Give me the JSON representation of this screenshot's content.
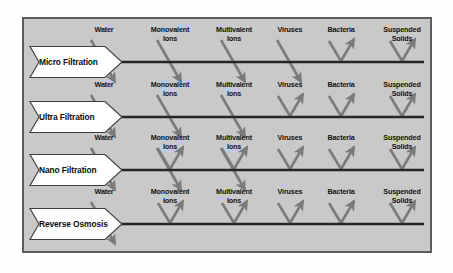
{
  "figure": {
    "panel_bg": "#c9c9c9",
    "panel_border": "#5d5d5d",
    "arrow_color": "#7b7b7b",
    "membrane_color": "#262626",
    "banner_fill": "#ffffff",
    "banner_stroke": "#3d3d3d"
  },
  "chart_data": {
    "type": "diagram",
    "xlabel": "",
    "ylabel": "",
    "categories": [
      "Water",
      "Monovalent Ions",
      "Multivalent Ions",
      "Viruses",
      "Bacteria",
      "Suspended Solids"
    ],
    "legend": [
      "pass = arrow crosses membrane downward",
      "reject = arrow deflects upward"
    ],
    "series": [
      {
        "name": "Micro Filtration",
        "values": [
          "pass",
          "pass",
          "pass",
          "pass",
          "reject",
          "reject"
        ]
      },
      {
        "name": "Ultra Filtration",
        "values": [
          "pass",
          "pass",
          "pass",
          "reject",
          "reject",
          "reject"
        ]
      },
      {
        "name": "Nano Filtration",
        "values": [
          "pass",
          "partial",
          "partial",
          "reject",
          "reject",
          "reject"
        ]
      },
      {
        "name": "Reverse Osmosis",
        "values": [
          "pass",
          "reject",
          "reject",
          "reject",
          "reject",
          "reject"
        ]
      }
    ]
  },
  "rows": [
    {
      "stage": "Micro Filtration",
      "membrane_y": 62,
      "label_y": 26,
      "banner_cy": 62,
      "species": [
        {
          "name": "Water",
          "x": 104,
          "mode": "pass"
        },
        {
          "name": "Monovalent\nIons",
          "x": 170,
          "mode": "pass"
        },
        {
          "name": "Multivalent\nIons",
          "x": 234,
          "mode": "pass"
        },
        {
          "name": "Viruses",
          "x": 290,
          "mode": "pass"
        },
        {
          "name": "Bacteria",
          "x": 341,
          "mode": "reject"
        },
        {
          "name": "Suspended\nSolids",
          "x": 402,
          "mode": "reject"
        }
      ]
    },
    {
      "stage": "Ultra Filtration",
      "membrane_y": 117,
      "label_y": 81,
      "banner_cy": 117,
      "species": [
        {
          "name": "Water",
          "x": 104,
          "mode": "pass"
        },
        {
          "name": "Monovalent\nIons",
          "x": 170,
          "mode": "pass"
        },
        {
          "name": "Multivalent\nIons",
          "x": 234,
          "mode": "pass"
        },
        {
          "name": "Viruses",
          "x": 290,
          "mode": "reject"
        },
        {
          "name": "Bacteria",
          "x": 341,
          "mode": "reject"
        },
        {
          "name": "Suspended\nSolids",
          "x": 402,
          "mode": "reject"
        }
      ]
    },
    {
      "stage": "Nano Filtration",
      "membrane_y": 170,
      "label_y": 134,
      "banner_cy": 170,
      "species": [
        {
          "name": "Water",
          "x": 104,
          "mode": "pass"
        },
        {
          "name": "Monovalent\nIons",
          "x": 170,
          "mode": "partial"
        },
        {
          "name": "Multivalent\nIons",
          "x": 234,
          "mode": "partial"
        },
        {
          "name": "Viruses",
          "x": 290,
          "mode": "reject"
        },
        {
          "name": "Bacteria",
          "x": 341,
          "mode": "reject"
        },
        {
          "name": "Suspended\nSolids",
          "x": 402,
          "mode": "reject"
        }
      ]
    },
    {
      "stage": "Reverse Osmosis",
      "membrane_y": 224,
      "label_y": 188,
      "banner_cy": 224,
      "species": [
        {
          "name": "Water",
          "x": 104,
          "mode": "pass"
        },
        {
          "name": "Monovalent\nIons",
          "x": 170,
          "mode": "reject"
        },
        {
          "name": "Multivalent\nIons",
          "x": 234,
          "mode": "reject"
        },
        {
          "name": "Viruses",
          "x": 290,
          "mode": "reject"
        },
        {
          "name": "Bacteria",
          "x": 341,
          "mode": "reject"
        },
        {
          "name": "Suspended\nSolids",
          "x": 402,
          "mode": "reject"
        }
      ]
    }
  ]
}
